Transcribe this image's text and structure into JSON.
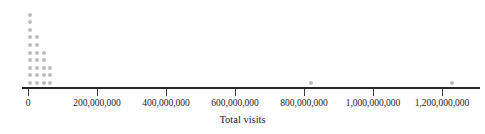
{
  "chart_data": {
    "type": "scatter",
    "plot_style": "dot-plot",
    "title": "",
    "xlabel": "Total visits",
    "ylabel": "",
    "xlim": [
      -20000000,
      1320000000
    ],
    "grid": false,
    "legend": null,
    "tick_labels": [
      "0",
      "200,000,000",
      "400,000,000",
      "600,000,000",
      "800,000,000",
      "1,000,000,000",
      "1,200,000,000"
    ],
    "ticks": [
      0,
      200000000,
      400000000,
      600000000,
      800000000,
      1000000000,
      1200000000
    ],
    "dot_color": "#bdbdbd",
    "axis_color": "#262626",
    "bins": [
      {
        "x": 5000000,
        "count": 10
      },
      {
        "x": 25000000,
        "count": 7
      },
      {
        "x": 45000000,
        "count": 5
      },
      {
        "x": 65000000,
        "count": 3
      },
      {
        "x": 820000000,
        "count": 1
      },
      {
        "x": 1230000000,
        "count": 1
      }
    ],
    "values": [
      5000000,
      5000000,
      5000000,
      5000000,
      5000000,
      5000000,
      5000000,
      5000000,
      5000000,
      5000000,
      25000000,
      25000000,
      25000000,
      25000000,
      25000000,
      25000000,
      25000000,
      45000000,
      45000000,
      45000000,
      45000000,
      45000000,
      65000000,
      65000000,
      65000000,
      820000000,
      1230000000
    ],
    "n": 27,
    "dot_geometry": {
      "x0_px": 28,
      "px_per_tick": 69.0,
      "tick_step_value": 200000000,
      "baseline_y_px": 81,
      "row_step_px": 7.6,
      "col_step_px": 9.2,
      "dot_size_px": 4
    }
  }
}
